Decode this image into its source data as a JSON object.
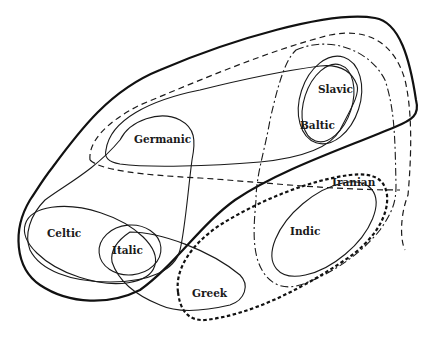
{
  "diagram": {
    "type": "euler-diagram",
    "labels": {
      "germanic": "Germanic",
      "slavic": "Slavic",
      "baltic": "Baltic",
      "iranian": "Iranian",
      "indic": "Indic",
      "celtic": "Celtic",
      "italic": "Italic",
      "greek": "Greek"
    },
    "line_styles": {
      "outer_boundary": "thick-solid",
      "northern_loop": "dashed",
      "eastern_loop": "dash-dot",
      "southeastern_loop": "bold-dotted",
      "group_outlines": "thin-solid"
    },
    "colors": {
      "background": "#ffffff",
      "ink": "#1a1a1a"
    }
  }
}
